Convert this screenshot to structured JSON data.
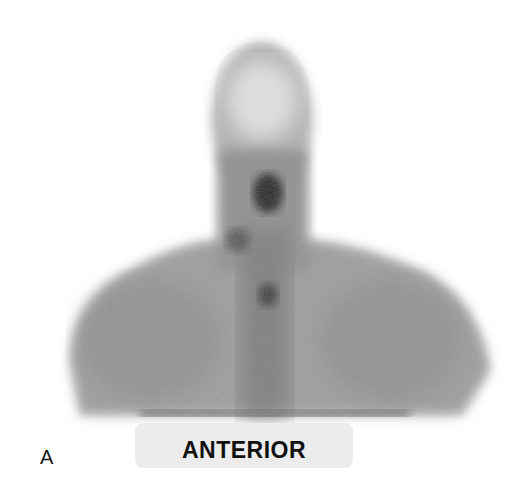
{
  "figure": {
    "panel_letter": "A",
    "view_label": "ANTERIOR",
    "colors": {
      "background": "#ffffff",
      "body_uptake": "#8a8a8a",
      "hot_spot": "#1e1e1e",
      "label_box": "#ececec"
    }
  }
}
